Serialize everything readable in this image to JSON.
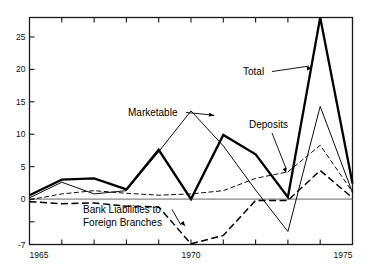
{
  "chart_data": {
    "type": "line",
    "title": "",
    "subtitle": "",
    "xlabel": "",
    "ylabel": "",
    "xlim": [
      1965,
      1975
    ],
    "ylim": [
      -7,
      28
    ],
    "grid": false,
    "zero_line": true,
    "legend_position": "inline-annotations",
    "x_tick_labels": [
      "1965",
      "1970",
      "1975"
    ],
    "x_tick_label_years": [
      1965,
      1970,
      1975
    ],
    "x_ticks_all_years": [
      1965,
      1966,
      1967,
      1968,
      1969,
      1970,
      1971,
      1972,
      1973,
      1974,
      1975
    ],
    "y_tick_labels": [
      "25",
      "20",
      "15",
      "10",
      "5",
      "0",
      "-7"
    ],
    "y_tick_values": [
      25,
      20,
      15,
      10,
      5,
      0,
      -7
    ],
    "y_minor_tick_values": [
      -3.5
    ],
    "x": [
      1965,
      1966,
      1967,
      1968,
      1969,
      1970,
      1971,
      1972,
      1973,
      1974,
      1975
    ],
    "series": [
      {
        "name": "Total",
        "style": "thick-solid",
        "values": [
          0.6,
          3.0,
          3.2,
          1.5,
          7.6,
          0.0,
          9.9,
          6.9,
          0.3,
          28.0,
          2.4
        ]
      },
      {
        "name": "Marketable",
        "style": "thin-solid",
        "values": [
          0.2,
          2.6,
          0.8,
          1.3,
          7.3,
          13.6,
          8.2,
          1.4,
          -5.0,
          14.3,
          1.0
        ]
      },
      {
        "name": "Deposits",
        "style": "thin-dashed",
        "values": [
          -0.1,
          0.8,
          1.3,
          0.9,
          0.6,
          0.8,
          1.3,
          3.2,
          4.2,
          8.3,
          1.1
        ]
      },
      {
        "name": "Bank Liabilities to Foreign Branches",
        "style": "thick-dashed",
        "values": [
          -0.4,
          -0.7,
          -0.6,
          -1.1,
          -1.2,
          -6.9,
          -5.6,
          -0.2,
          -0.2,
          4.4,
          0.2
        ]
      }
    ],
    "annotations": [
      {
        "id": "marketable",
        "label": "Marketable",
        "target_x": 1971,
        "target_y": 13.6
      },
      {
        "id": "total",
        "label": "Total",
        "target_x": 1974,
        "target_y": 28.0
      },
      {
        "id": "deposits",
        "label": "Deposits",
        "target_x": 1973,
        "target_y": 4.2
      },
      {
        "id": "bank-liabilities",
        "label_line1": "Bank Liabilities to",
        "label_line2": "Foreign Branches",
        "target_x": 1970,
        "target_y": -6.9
      }
    ],
    "colors": {
      "background": "#ffffff",
      "ink": "#000000",
      "axis": "#1a1a1a",
      "zero_line": "#555555"
    }
  }
}
